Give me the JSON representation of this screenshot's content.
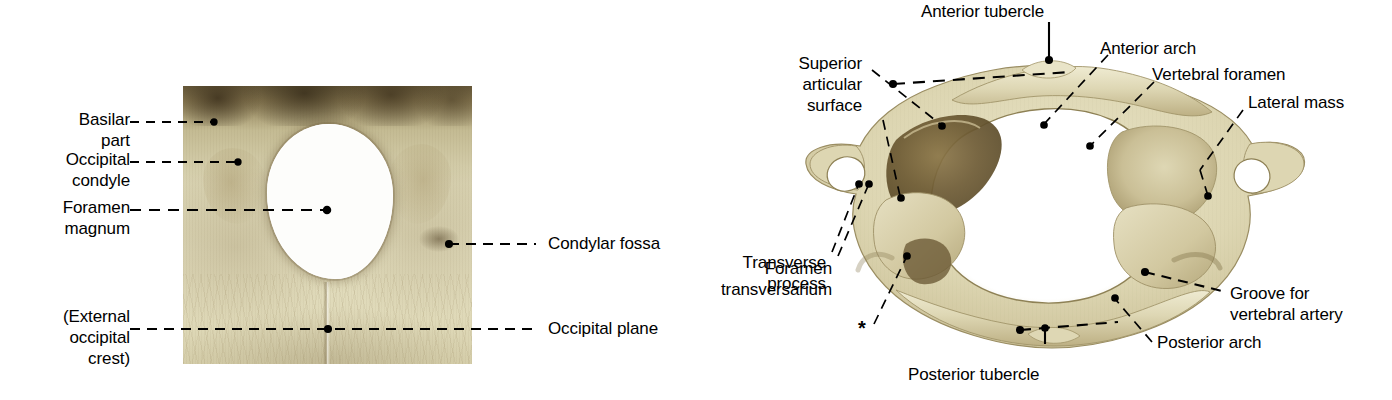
{
  "figure": {
    "background_color": "#ffffff",
    "label_color": "#000000",
    "leader_color": "#000000",
    "bone_color_light": "#e2ddbe",
    "bone_color_mid": "#cfc49b",
    "bone_color_dark": "#8c7c54",
    "bone_color_shadow": "#5c4c2c",
    "aperture_color": "#fdfdfb"
  },
  "panels": [
    {
      "id": "occipital-bone",
      "name": "Occipital bone, inferior view",
      "x": 183,
      "y": 86,
      "width": 289,
      "height": 278
    },
    {
      "id": "atlas-vertebra",
      "name": "Atlas (C1 vertebra), superior view",
      "x": 800,
      "y": 28,
      "width": 512,
      "height": 340
    }
  ],
  "labels": {
    "basilar_part": {
      "text": "Basilar\npart",
      "x": 60,
      "y": 112,
      "align": "right",
      "lines": 2
    },
    "occipital_condyle": {
      "text": "Occipital\ncondyle",
      "x": 52,
      "y": 152,
      "align": "right",
      "lines": 2
    },
    "foramen_magnum": {
      "text": "Foramen\nmagnum",
      "x": 47,
      "y": 197,
      "align": "right",
      "lines": 2
    },
    "external_occipital_crest": {
      "text": "(External\noccipital\ncrest)",
      "x": 40,
      "y": 310,
      "align": "right",
      "lines": 3
    },
    "condylar_fossa": {
      "text": "Condylar fossa",
      "x": 548,
      "y": 233,
      "align": "left",
      "lines": 1
    },
    "occipital_plane": {
      "text": "Occipital plane",
      "x": 548,
      "y": 315,
      "align": "left",
      "lines": 1
    },
    "anterior_tubercle": {
      "text": "Anterior tubercle",
      "x": 906,
      "y": 2,
      "align": "left",
      "lines": 1
    },
    "anterior_arch": {
      "text": "Anterior arch",
      "x": 1100,
      "y": 38,
      "align": "left",
      "lines": 1
    },
    "vertebral_foramen": {
      "text": "Vertebral foramen",
      "x": 1152,
      "y": 64,
      "align": "left",
      "lines": 1
    },
    "lateral_mass": {
      "text": "Lateral mass",
      "x": 1242,
      "y": 92,
      "align": "left",
      "lines": 1
    },
    "superior_articular_surface": {
      "text": "Superior\narticular\nsurface",
      "x": 862,
      "y": 53,
      "align": "right",
      "lines": 3
    },
    "transverse_process": {
      "text": "Transverse\nprocess",
      "x": 826,
      "y": 252,
      "align": "right",
      "lines": 2
    },
    "foramen_transversarium": {
      "text": "Foramen\ntransversarium",
      "x": 832,
      "y": 258,
      "align": "right",
      "lines": 2
    },
    "asterisk": {
      "text": "*",
      "x": 858,
      "y": 318,
      "align": "left",
      "lines": 1
    },
    "posterior_tubercle": {
      "text": "Posterior tubercle",
      "x": 908,
      "y": 364,
      "align": "left",
      "lines": 1
    },
    "posterior_arch": {
      "text": "Posterior arch",
      "x": 1157,
      "y": 342,
      "align": "left",
      "lines": 1
    },
    "groove_for_vertebral_artery": {
      "text": "Groove for\nvertebral artery",
      "x": 1230,
      "y": 289,
      "align": "left",
      "lines": 2
    }
  },
  "annotation_list": [
    "Basilar part",
    "Occipital condyle",
    "Foramen magnum",
    "(External occipital crest)",
    "Condylar fossa",
    "Occipital plane",
    "Anterior tubercle",
    "Anterior arch",
    "Vertebral foramen",
    "Lateral mass",
    "Superior articular surface",
    "Transverse process",
    "Foramen transversarium",
    "*",
    "Posterior tubercle",
    "Posterior arch",
    "Groove for vertebral artery"
  ]
}
